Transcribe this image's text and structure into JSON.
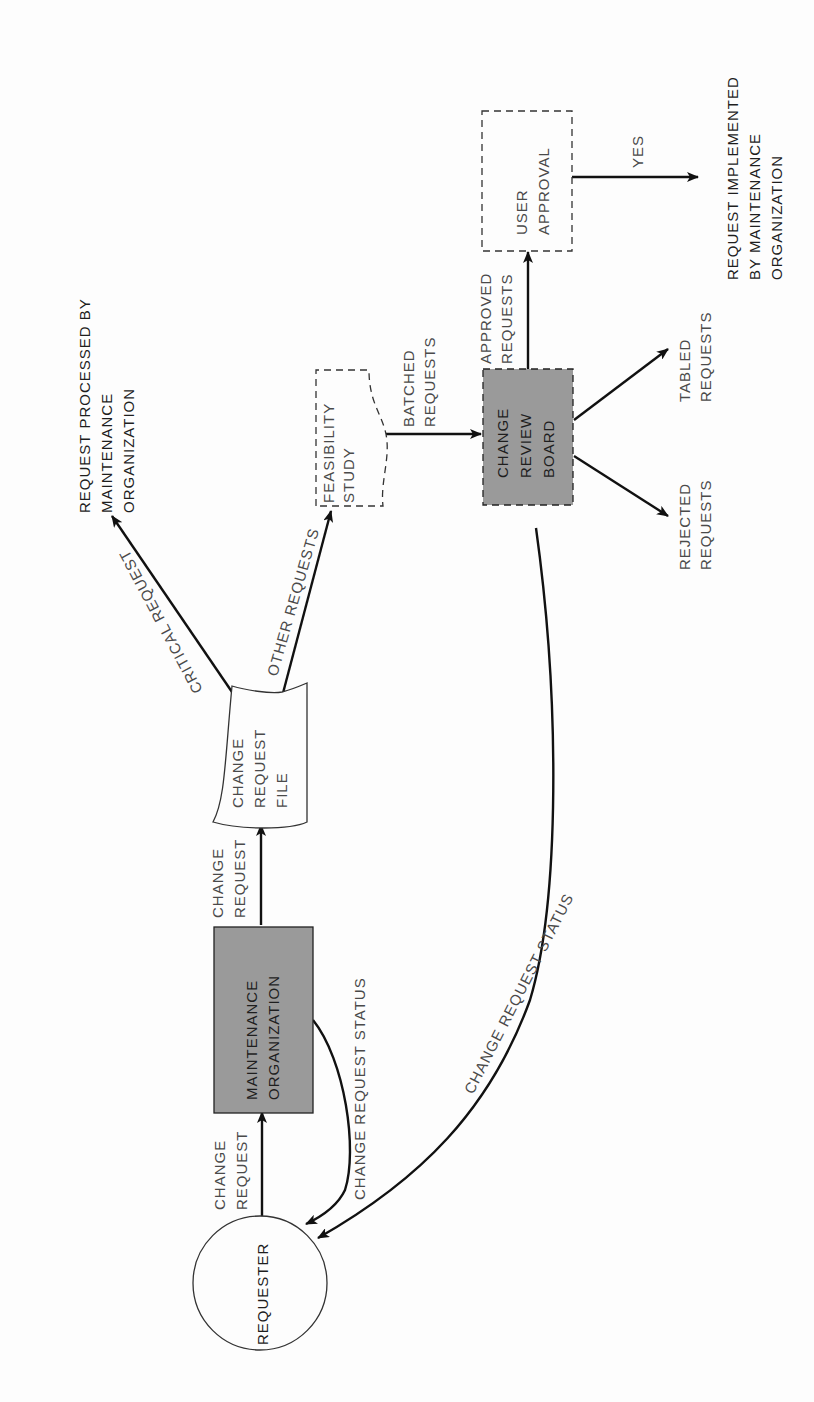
{
  "diagram": {
    "orientation": "rotated -90 degrees (text reads bottom-to-top)",
    "colors": {
      "background": "#fdfdfd",
      "shaded_node": "#9a9a9a",
      "line": "#111111",
      "label_text": "#4a4a4a"
    },
    "nodes": {
      "requester": {
        "label": "REQUESTER",
        "shape": "circle"
      },
      "maintenance_org": {
        "lines": [
          "MAINTENANCE",
          "ORGANIZATION"
        ],
        "shape": "shaded-rectangle"
      },
      "change_request_file": {
        "lines": [
          "CHANGE",
          "REQUEST",
          "FILE"
        ],
        "shape": "document"
      },
      "feasibility_study": {
        "lines": [
          "FEASIBILITY",
          "STUDY"
        ],
        "shape": "dashed-document"
      },
      "change_review_board": {
        "lines": [
          "CHANGE",
          "REVIEW",
          "BOARD"
        ],
        "shape": "shaded-dashed-rectangle"
      },
      "user_approval": {
        "lines": [
          "USER",
          "APPROVAL"
        ],
        "shape": "dashed-rectangle"
      }
    },
    "outcomes": {
      "processed": {
        "lines": [
          "REQUEST PROCESSED BY",
          "MAINTENANCE",
          "ORGANIZATION"
        ]
      },
      "implemented": {
        "lines": [
          "REQUEST IMPLEMENTED",
          "BY MAINTENANCE",
          "ORGANIZATION"
        ]
      },
      "rejected": {
        "lines": [
          "REJECTED",
          "REQUESTS"
        ]
      },
      "tabled": {
        "lines": [
          "TABLED",
          "REQUESTS"
        ]
      }
    },
    "edges": {
      "req_to_maint": {
        "lines": [
          "CHANGE",
          "REQUEST"
        ]
      },
      "maint_to_file": {
        "lines": [
          "CHANGE",
          "REQUEST"
        ]
      },
      "maint_status": {
        "label": "CHANGE REQUEST STATUS"
      },
      "board_status": {
        "label": "CHANGE REQUEST STATUS"
      },
      "critical": {
        "label": "CRITICAL REQUEST"
      },
      "other": {
        "label": "OTHER REQUESTS"
      },
      "batched": {
        "lines": [
          "BATCHED",
          "REQUESTS"
        ]
      },
      "approved": {
        "lines": [
          "APPROVED",
          "REQUESTS"
        ]
      },
      "yes": {
        "label": "YES"
      }
    }
  }
}
